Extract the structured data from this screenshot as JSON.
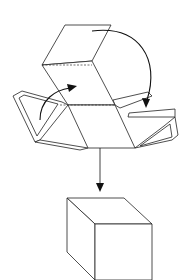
{
  "diagram": {
    "title": "",
    "colors": {
      "line": "#222222",
      "arrow": "#111111",
      "background": "#ffffff"
    },
    "net": {
      "top_face": "65,25 111,25 92,61 42,65",
      "middle_face": "42,65 92,61 115,105 68,105",
      "fold_line_top": {
        "x1": 42,
        "y1": 65,
        "x2": 92,
        "y2": 65
      },
      "fold_line_bottom": {
        "x1": 60,
        "y1": 105,
        "x2": 115,
        "y2": 105
      },
      "bottom_face": "68,105 115,105 135,148 88,148",
      "left_flap_outer": "13,96 22,91 62,102 68,105 40,140 35,142",
      "left_flap_inner": "19,98 24,95 58,104 37,136",
      "left_flap_lower": "35,142 40,140 88,148 80,150",
      "right_flap_upper": "115,105 113,100 148,92 152,96 120,108",
      "right_tab": "129,113 175,109 175,117 128,117",
      "right_flap_lower": "135,148 164,126 175,117 178,135 172,140",
      "right_flap_lower_inner": "140,146 170,124 172,137"
    },
    "arrows": [
      {
        "name": "fold-arrow-left",
        "path": "M40,120 C40,100 55,90 70,88",
        "head": "77,86 67,84 69,92"
      },
      {
        "name": "fold-arrow-right",
        "path": "M92,31 C140,25 160,60 147,100",
        "head": "146,108 142,98 150,99"
      },
      {
        "name": "result-arrow-down",
        "path": "M100,148 L100,185",
        "head": "100,192 96,183 104,183"
      }
    ],
    "cube": {
      "top": "67,198 124,198 152,224 95,224",
      "front": "95,224 152,224 152,280 95,280",
      "side": "67,198 95,224 95,280 67,252"
    }
  }
}
